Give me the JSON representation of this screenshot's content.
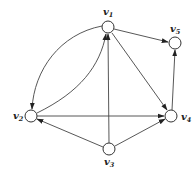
{
  "diagram": {
    "type": "directed-graph",
    "nodes": [
      {
        "id": "v1",
        "base": "v",
        "sub": "1",
        "x": 108,
        "y": 27
      },
      {
        "id": "v2",
        "base": "v",
        "sub": "2",
        "x": 31,
        "y": 116
      },
      {
        "id": "v3",
        "base": "v",
        "sub": "3",
        "x": 109,
        "y": 149
      },
      {
        "id": "v4",
        "base": "v",
        "sub": "4",
        "x": 171,
        "y": 116
      },
      {
        "id": "v5",
        "base": "v",
        "sub": "5",
        "x": 175,
        "y": 43
      }
    ],
    "edges": [
      {
        "from": "v1",
        "to": "v2",
        "shape": "outer-arc"
      },
      {
        "from": "v2",
        "to": "v1",
        "shape": "inner-arc"
      },
      {
        "from": "v1",
        "to": "v5",
        "shape": "straight"
      },
      {
        "from": "v1",
        "to": "v4",
        "shape": "straight"
      },
      {
        "from": "v4",
        "to": "v5",
        "shape": "straight"
      },
      {
        "from": "v2",
        "to": "v4",
        "shape": "straight"
      },
      {
        "from": "v3",
        "to": "v1",
        "shape": "straight"
      },
      {
        "from": "v3",
        "to": "v2",
        "shape": "straight"
      },
      {
        "from": "v3",
        "to": "v4",
        "shape": "straight"
      }
    ]
  },
  "labels": {
    "v1": {
      "base": "v",
      "sub": "1"
    },
    "v2": {
      "base": "v",
      "sub": "2"
    },
    "v3": {
      "base": "v",
      "sub": "3"
    },
    "v4": {
      "base": "v",
      "sub": "4"
    },
    "v5": {
      "base": "v",
      "sub": "5"
    }
  }
}
